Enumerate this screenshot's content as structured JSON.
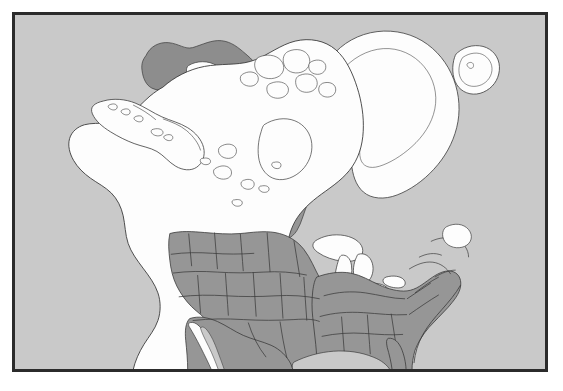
{
  "figure": {
    "type": "range-map",
    "title": "",
    "region": "North America",
    "projection": "polar-oblique",
    "frame": {
      "visible": true,
      "border_color": "#2b2b2b",
      "border_width_px": 2,
      "margin_px": 12
    }
  },
  "colors": {
    "ocean": "#c9c9c9",
    "land": "#fdfdfd",
    "range_shading": "#969696",
    "range_shading_dark": "#8d8d8d",
    "coastline": "#3a3a3a",
    "state_border": "#3a3a3a",
    "frame": "#2b2b2b",
    "page_background": "#ffffff"
  },
  "legend": {
    "present": false,
    "entries": [
      {
        "label": "Breeding / resident range",
        "swatch": "#969696"
      },
      {
        "label": "Land outside range",
        "swatch": "#fdfdfd"
      },
      {
        "label": "Ocean",
        "swatch": "#c9c9c9"
      }
    ]
  },
  "features": {
    "landmasses": [
      "Alaska",
      "Aleutian Islands",
      "Canada",
      "Canadian Arctic Archipelago",
      "Greenland",
      "Iceland",
      "Contiguous United States",
      "Mexico",
      "Baja California"
    ],
    "water_bodies": [
      "Pacific Ocean",
      "Atlantic Ocean",
      "Arctic Ocean",
      "Beaufort Sea",
      "Hudson Bay",
      "Baffin Bay",
      "Gulf of Mexico",
      "Great Lakes",
      "Great Slave Lake",
      "Great Bear Lake",
      "Lake Winnipeg"
    ],
    "shaded_range_areas": [
      "Western United States",
      "Southeastern United States",
      "Northern Mexico",
      "Beaufort Sea / Arctic coastal waters",
      "Baffin Bay corridor",
      "Labrador Sea margin"
    ],
    "boundaries_shown": [
      "United States state borders",
      "International coastline outlines"
    ]
  },
  "annotations": {
    "labels": [],
    "scale_bar": false,
    "north_arrow": false,
    "graticule": false
  }
}
